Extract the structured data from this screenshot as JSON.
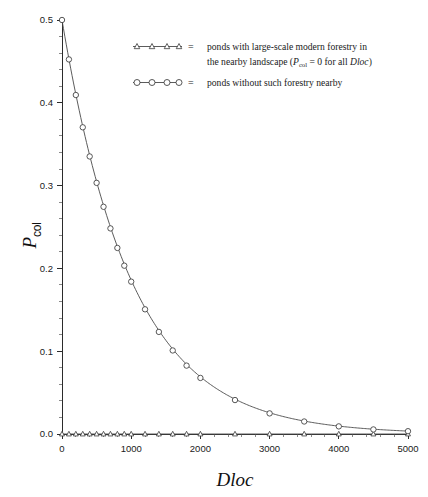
{
  "chart_data": {
    "type": "line",
    "title": "",
    "xlabel": "Dloc",
    "ylabel": "P_col",
    "ylabel_base": "P",
    "ylabel_sub": "col",
    "xlim": [
      0,
      5000
    ],
    "ylim": [
      0,
      0.5
    ],
    "xticks": [
      0,
      1000,
      2000,
      3000,
      4000,
      5000
    ],
    "xticklabels": [
      "0",
      "1000",
      "2000",
      "3000",
      "4000",
      "5000"
    ],
    "yticks": [
      0.0,
      0.1,
      0.2,
      0.3,
      0.4,
      0.5
    ],
    "yticklabels": [
      "0.0",
      "0.1",
      "0.2",
      "0.3",
      "0.4",
      "0.5"
    ],
    "grid": false,
    "legend_position": "upper-center-right",
    "series": [
      {
        "name": "ponds without such forestry nearby",
        "marker": "circle-open",
        "x": [
          0,
          100,
          200,
          300,
          400,
          500,
          600,
          700,
          800,
          900,
          1000,
          1200,
          1400,
          1600,
          1800,
          2000,
          2500,
          3000,
          3500,
          4000,
          4500,
          5000
        ],
        "values": [
          0.5,
          0.4524,
          0.4094,
          0.3704,
          0.3352,
          0.3033,
          0.2744,
          0.2483,
          0.2247,
          0.2033,
          0.184,
          0.1506,
          0.1233,
          0.1009,
          0.0826,
          0.0677,
          0.041,
          0.0249,
          0.0151,
          0.0092,
          0.0055,
          0.0034
        ]
      },
      {
        "name": "ponds with large-scale modern forestry in the nearby landscape",
        "marker": "triangle-open",
        "x": [
          0,
          100,
          200,
          300,
          400,
          500,
          600,
          700,
          800,
          900,
          1000,
          1200,
          1400,
          1600,
          1800,
          2000,
          2500,
          3000,
          3500,
          4000,
          4500,
          5000
        ],
        "values": [
          0,
          0,
          0,
          0,
          0,
          0,
          0,
          0,
          0,
          0,
          0,
          0,
          0,
          0,
          0,
          0,
          0,
          0,
          0,
          0,
          0,
          0
        ]
      }
    ]
  },
  "legend": {
    "entries": [
      {
        "marker": "triangle-open",
        "equals": "=",
        "line1": "ponds with large-scale modern forestry in",
        "line2_prefix": "the nearby landscape (",
        "line2_symbol": "P",
        "line2_subscript": "col",
        "line2_mid": " = 0 for all ",
        "line2_italic": "Dloc",
        "line2_suffix": ")"
      },
      {
        "marker": "circle-open",
        "equals": "=",
        "line1": "ponds without such forestry nearby",
        "line2_prefix": "",
        "line2_symbol": "",
        "line2_subscript": "",
        "line2_mid": "",
        "line2_italic": "",
        "line2_suffix": ""
      }
    ]
  },
  "colors": {
    "line": "#4a4a4a",
    "marker_stroke": "#3a3a3a",
    "marker_fill": "#ffffff",
    "axis": "#2b2b2b",
    "text": "#1a1a1a",
    "background": "#ffffff"
  }
}
